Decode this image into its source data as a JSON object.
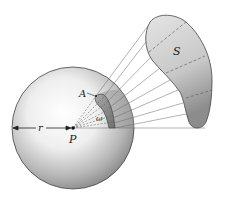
{
  "diagram": {
    "type": "solid-angle-illustration",
    "labels": {
      "surface": "S",
      "area": "A",
      "radius": "r",
      "point": "P",
      "solid_angle": "ω"
    },
    "colors": {
      "sphere_light": "#ffffff",
      "sphere_dark": "#8a8a8a",
      "surface_fill": "#cfcfcf",
      "surface_dark": "#8c8c8c",
      "patch_fill": "#8e8e8e",
      "line": "#555555",
      "text": "#1a1a1a"
    }
  }
}
